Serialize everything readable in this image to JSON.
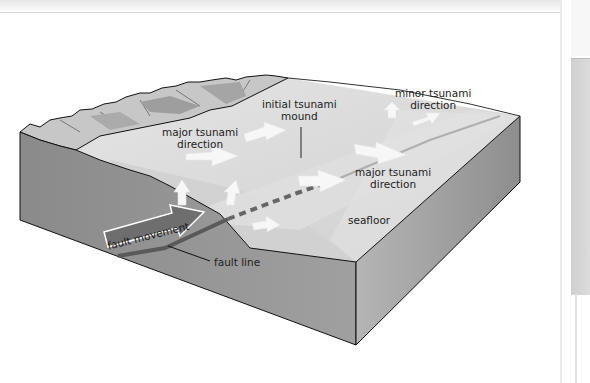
{
  "diagram": {
    "type": "block-diagram",
    "labels": {
      "initial_mound": [
        "initial tsunami",
        "mound"
      ],
      "major_left": [
        "major tsunami",
        "direction"
      ],
      "minor": [
        "minor tsunami",
        "direction"
      ],
      "major_right": [
        "major tsunami",
        "direction"
      ],
      "seafloor": "seafloor",
      "fault_movement": "fault movement",
      "fault_line": "fault line"
    },
    "colors": {
      "water_surface": "#d9d9d9",
      "seafloor_top": "#c9c9c9",
      "block_front": "#8f8f8f",
      "block_side": "#a3a3a3",
      "coast_dark": "#7a7a7a",
      "arrow_fill": "#f5f5f5",
      "fault_arrow": "#6e6e6e",
      "outline": "#111111"
    }
  }
}
